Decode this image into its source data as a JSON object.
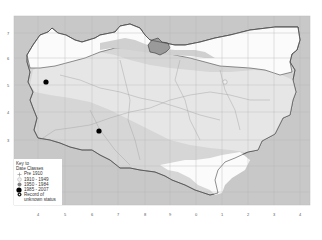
{
  "map": {
    "colors": {
      "sea": "#c8c8c8",
      "frame": "#bdbdbd",
      "pre_1910": "#fbfbfb",
      "1910_1949": "#e9e9e9",
      "1950_1984": "#d6d6d6",
      "grid": "#b5b5b5",
      "coast": "#444444",
      "river": "#a8a8a8",
      "record_dot": "#000000"
    },
    "x_ticks": [
      "4",
      "5",
      "6",
      "7",
      "8",
      "9",
      "0",
      "1",
      "2",
      "3",
      "4"
    ],
    "y_ticks": [
      "7",
      "6",
      "5",
      "4",
      "3"
    ],
    "records": [
      {
        "class": "1985 - 2007",
        "x": 46,
        "y": 82
      },
      {
        "class": "1985 - 2007",
        "x": 99,
        "y": 131
      }
    ]
  },
  "legend": {
    "title_line1": "Key to",
    "title_line2": "Date Classes",
    "items": [
      {
        "symbol": "plus",
        "label": "Pre 1910"
      },
      {
        "symbol": "circle-open",
        "label": "1910 - 1949"
      },
      {
        "symbol": "circle-grey",
        "label": "1950 - 1984"
      },
      {
        "symbol": "circle-black",
        "label": "1985 - 2007"
      },
      {
        "symbol": "circle-dotted",
        "label": "Record of"
      }
    ],
    "continuation": "unknown status"
  }
}
